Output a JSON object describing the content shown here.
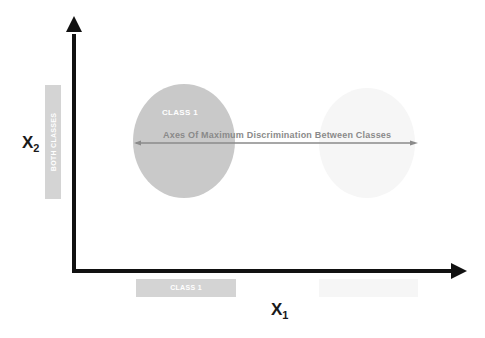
{
  "diagram": {
    "axes": {
      "x_label": "X",
      "x_subscript": "1",
      "y_label": "X",
      "y_subscript": "2"
    },
    "class1_ellipse": {
      "label": "CLASS 1",
      "color": "#c9c9c9"
    },
    "class2_ellipse": {
      "label": "",
      "color": "#f6f6f6"
    },
    "discrimination_axis": {
      "label": "Axes Of Maximum Discrimination Between Classes",
      "color": "#8a8a8a"
    },
    "y_projection_bar": {
      "label": "BOTH CLASSES",
      "color": "#d4d4d4"
    },
    "x_projection_bars": [
      {
        "label": "CLASS 1",
        "color": "#d4d4d4"
      },
      {
        "label": "",
        "color": "#f6f6f6"
      }
    ],
    "axis_color": "#111111"
  }
}
